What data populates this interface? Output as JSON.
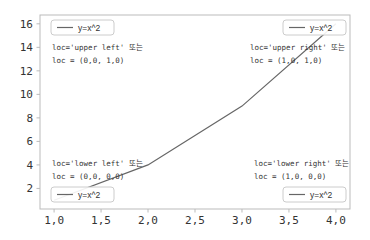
{
  "chart_data": {
    "type": "line",
    "title": "",
    "xlabel": "",
    "ylabel": "",
    "x": [
      1,
      2,
      3,
      4
    ],
    "series": [
      {
        "name": "y=x^2",
        "values": [
          1,
          4,
          9,
          16
        ],
        "color": "#666666"
      }
    ],
    "xlim": [
      0.85,
      4.15
    ],
    "ylim": [
      0.25,
      16.75
    ],
    "xticks": [
      1.0,
      1.5,
      2.0,
      2.5,
      3.0,
      3.5,
      4.0
    ],
    "xtick_labels": [
      "1,0",
      "1,5",
      "2,0",
      "2,5",
      "3,0",
      "3,5",
      "4,0"
    ],
    "yticks": [
      2,
      4,
      6,
      8,
      10,
      12,
      14,
      16
    ],
    "ytick_labels": [
      "2",
      "4",
      "6",
      "8",
      "10",
      "12",
      "14",
      "16"
    ],
    "grid": false,
    "legends": [
      {
        "position": "upper left",
        "label": "y=x^2",
        "annotation": [
          "loc='upper left' 또는",
          "loc = (0,0, 1,0)"
        ]
      },
      {
        "position": "upper right",
        "label": "y=x^2",
        "annotation": [
          "loc='upper right' 또는",
          "loc = (1,0, 1,0)"
        ]
      },
      {
        "position": "lower left",
        "label": "y=x^2",
        "annotation": [
          "loc='lower left' 또는",
          "loc = (0,0, 0,0)"
        ]
      },
      {
        "position": "lower right",
        "label": "y=x^2",
        "annotation": [
          "loc='lower right' 또는",
          "loc = (1,0, 0,0)"
        ]
      }
    ]
  },
  "legend_label": "y=x^2",
  "annotations": {
    "upper_left": {
      "line1": "loc='upper left' 또는",
      "line2": "loc = (0,0, 1,0)"
    },
    "upper_right": {
      "line1": "loc='upper right' 또는",
      "line2": "loc = (1,0, 1,0)"
    },
    "lower_left": {
      "line1": "loc='lower left' 또는",
      "line2": "loc = (0,0, 0,0)"
    },
    "lower_right": {
      "line1": "loc='lower right' 또는",
      "line2": "loc = (1,0, 0,0)"
    }
  },
  "colors": {
    "line": "#666666",
    "axes": "#bbbbbb",
    "legend_border": "#cccccc",
    "text": "#333333"
  }
}
